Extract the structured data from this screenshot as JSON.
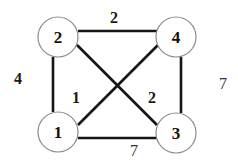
{
  "diagram": {
    "type": "weighted-undirected-graph",
    "nodes": [
      {
        "id": "1",
        "label": "1",
        "cx": 58,
        "cy": 132,
        "r": 20
      },
      {
        "id": "2",
        "label": "2",
        "cx": 58,
        "cy": 37,
        "r": 20
      },
      {
        "id": "3",
        "label": "3",
        "cx": 176,
        "cy": 132,
        "r": 20
      },
      {
        "id": "4",
        "label": "4",
        "cx": 176,
        "cy": 37,
        "r": 20
      }
    ],
    "edges": [
      {
        "from": "2",
        "to": "4",
        "weight": "2"
      },
      {
        "from": "2",
        "to": "1",
        "weight": "4"
      },
      {
        "from": "4",
        "to": "3",
        "weight": "7"
      },
      {
        "from": "1",
        "to": "3",
        "weight": "7"
      },
      {
        "from": "1",
        "to": "4",
        "weight": "1"
      },
      {
        "from": "2",
        "to": "3",
        "weight": "2"
      }
    ],
    "labels": {
      "node1": "1",
      "node2": "2",
      "node3": "3",
      "node4": "4",
      "w_2_4": "2",
      "w_2_1": "4",
      "w_4_3": "7",
      "w_1_3": "7",
      "w_1_4": "1",
      "w_2_3": "2"
    }
  }
}
